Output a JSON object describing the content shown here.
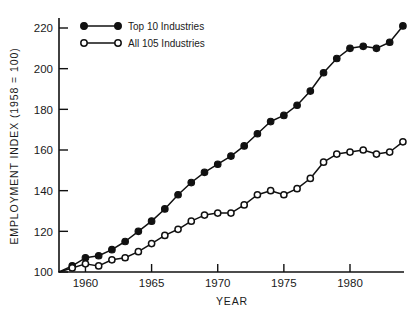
{
  "chart_data": {
    "type": "line",
    "title": "",
    "xlabel": "YEAR",
    "ylabel": "EMPLOYMENT INDEX (1958 = 100)",
    "xlim": [
      1958,
      1984
    ],
    "ylim": [
      100,
      224
    ],
    "yticks": [
      100,
      120,
      140,
      160,
      180,
      200,
      220
    ],
    "xticks": [
      1960,
      1965,
      1970,
      1975,
      1980
    ],
    "grid": false,
    "legend_position": "top-left",
    "x": [
      1958,
      1959,
      1960,
      1961,
      1962,
      1963,
      1964,
      1965,
      1966,
      1967,
      1968,
      1969,
      1970,
      1971,
      1972,
      1973,
      1974,
      1975,
      1976,
      1977,
      1978,
      1979,
      1980,
      1981,
      1982,
      1983,
      1984
    ],
    "series": [
      {
        "name": "Top 10 Industries",
        "marker": "filled-circle",
        "values": [
          100,
          103,
          107,
          108,
          111,
          115,
          120,
          125,
          131,
          138,
          144,
          149,
          153,
          157,
          162,
          168,
          174,
          177,
          182,
          189,
          198,
          205,
          210,
          211,
          210,
          213,
          221
        ]
      },
      {
        "name": "All 105 Industries",
        "marker": "open-circle",
        "values": [
          100,
          102,
          104,
          103,
          106,
          107,
          110,
          114,
          118,
          121,
          125,
          128,
          129,
          129,
          133,
          138,
          140,
          138,
          141,
          146,
          154,
          158,
          159,
          160,
          158,
          159,
          164
        ]
      }
    ]
  },
  "axes": {
    "y_tick_labels": [
      "220",
      "200",
      "180",
      "160",
      "140",
      "120",
      "100"
    ],
    "x_tick_labels": [
      "1960",
      "1965",
      "1970",
      "1975",
      "1980"
    ],
    "y_axis_title": "EMPLOYMENT INDEX (1958 = 100)",
    "x_axis_title": "YEAR"
  },
  "legend": {
    "items": [
      {
        "label": "Top 10 Industries",
        "marker": "filled-circle"
      },
      {
        "label": "All 105 Industries",
        "marker": "open-circle"
      }
    ]
  },
  "colors": {
    "line": "#111111",
    "marker_fill_top": "#111111",
    "marker_fill_all": "#ffffff",
    "background": "#ffffff",
    "text": "#1a1a1a"
  }
}
